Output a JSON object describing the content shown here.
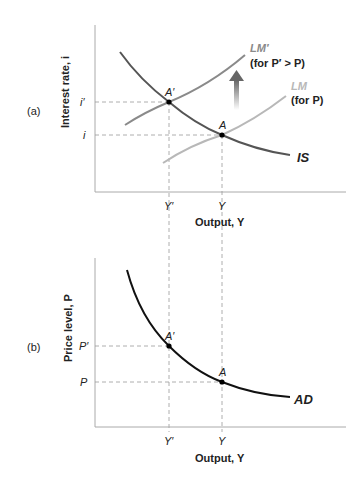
{
  "panel_a": {
    "tag": "(a)",
    "y_axis_label": "Interest rate, i",
    "x_axis_label": "Output, Y",
    "y_ticks": [
      "i′",
      "i"
    ],
    "x_ticks": [
      "Y′",
      "Y"
    ],
    "points": [
      "A′",
      "A"
    ],
    "curves": {
      "lm_prime": "LM′",
      "lm_prime_note": "(for P′ > P)",
      "lm": "LM",
      "lm_note": "(for P)",
      "is": "IS"
    }
  },
  "panel_b": {
    "tag": "(b)",
    "y_axis_label": "Price level, P",
    "x_axis_label": "Output, Y",
    "y_ticks": [
      "P′",
      "P"
    ],
    "x_ticks": [
      "Y′",
      "Y"
    ],
    "points": [
      "A′",
      "A"
    ],
    "curves": {
      "ad": "AD"
    }
  },
  "colors": {
    "is_curve": "#555555",
    "lm_prime_curve": "#8a8a8a",
    "lm_curve": "#b8b8b8",
    "ad_curve": "#111111",
    "axis": "#aaaaaa",
    "arrow": "#777777"
  }
}
